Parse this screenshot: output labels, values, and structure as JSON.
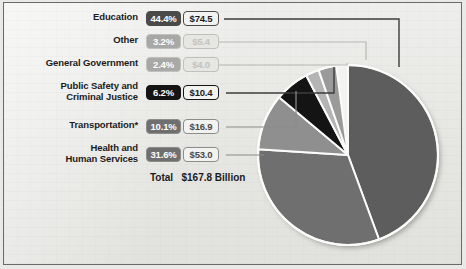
{
  "chart_data": {
    "type": "pie",
    "title": "",
    "total_label": "Total",
    "total_value": "$167.8 Billion",
    "unit": "Billion",
    "categories": [
      "Education",
      "Other",
      "General Government",
      "Public Safety and\nCriminal Justice",
      "Transportation*",
      "Health and\nHuman Services"
    ],
    "values": [
      74.5,
      5.4,
      4.0,
      10.4,
      16.9,
      53.0
    ],
    "percents": [
      44.4,
      3.2,
      2.4,
      6.2,
      10.1,
      31.6
    ],
    "percent_labels": [
      "44.4%",
      "3.2%",
      "2.4%",
      "6.2%",
      "10.1%",
      "31.6%"
    ],
    "value_labels": [
      "$74.5",
      "$5.4",
      "$4.0",
      "$10.4",
      "$16.9",
      "$53.0"
    ],
    "slice_colors": [
      "#5d5d5d",
      "#9a9a9a",
      "#b4b4b4",
      "#141414",
      "#8f8f8f",
      "#6f6f6f"
    ],
    "legend_position": "left",
    "grid": false,
    "ylabel": "",
    "xlabel": ""
  },
  "rows": [
    {
      "label": "Education",
      "percent": "44.4%",
      "amount": "$74.5",
      "pct_bg": "#4a4a4a",
      "pct_fg": "#ffffff",
      "amt_bg": "#f2f2f0",
      "amt_fg": "#1b1b1b",
      "border": "#4a4a4a",
      "muted": false
    },
    {
      "label": "Other",
      "percent": "3.2%",
      "amount": "$5.4",
      "pct_bg": "#a8a8a6",
      "pct_fg": "#ffffff",
      "amt_bg": "#e6e6e3",
      "amt_fg": "#c3c3c0",
      "border": "#c0c0bd",
      "muted": true
    },
    {
      "label": "General Government",
      "percent": "2.4%",
      "amount": "$4.0",
      "pct_bg": "#a8a8a6",
      "pct_fg": "#ffffff",
      "amt_bg": "#e6e6e3",
      "amt_fg": "#c3c3c0",
      "border": "#c0c0bd",
      "muted": true
    },
    {
      "label": "Public Safety and\nCriminal Justice",
      "percent": "6.2%",
      "amount": "$10.4",
      "pct_bg": "#141414",
      "pct_fg": "#ffffff",
      "amt_bg": "#f2f2f0",
      "amt_fg": "#1b1b1b",
      "border": "#141414",
      "muted": false
    },
    {
      "label": "Transportation*",
      "percent": "10.1%",
      "amount": "$16.9",
      "pct_bg": "#6f6f6f",
      "pct_fg": "#ffffff",
      "amt_bg": "#f2f2f0",
      "amt_fg": "#4a4a48",
      "border": "#8c8c8a",
      "muted": true
    },
    {
      "label": "Health and\nHuman Services",
      "percent": "31.6%",
      "amount": "$53.0",
      "pct_bg": "#6f6f6f",
      "pct_fg": "#ffffff",
      "amt_bg": "#f2f2f0",
      "amt_fg": "#4a4a48",
      "border": "#8c8c8a",
      "muted": true
    }
  ],
  "total": {
    "text": "Total   $167.8 Billion"
  },
  "colors": {
    "frame": "#6a6a68",
    "background": "#e9e9e7",
    "leader_dark": "#3c3c3c",
    "leader_light": "#b6b6b3"
  }
}
